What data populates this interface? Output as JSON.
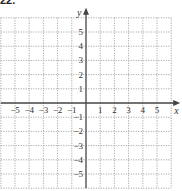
{
  "problem": {
    "label": "22."
  },
  "graph": {
    "x_axis_label": "x",
    "y_axis_label": "y",
    "x_range": [
      -6,
      6
    ],
    "y_range": [
      -6,
      6
    ],
    "x_ticks": [
      "-5",
      "-4",
      "-3",
      "-2",
      "-1",
      "1",
      "2",
      "3",
      "4",
      "5"
    ],
    "y_ticks": [
      "5",
      "4",
      "3",
      "2",
      "1",
      "-1",
      "-2",
      "-3",
      "-4",
      "-5"
    ],
    "grid": "dotted",
    "colors": {
      "axis": "#444444",
      "grid": "#9a9a9a",
      "text": "#333333"
    }
  }
}
